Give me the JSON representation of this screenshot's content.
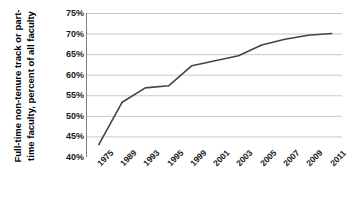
{
  "chart_data": {
    "type": "line",
    "title": "",
    "xlabel": "",
    "ylabel": "Full-time non-tenure track or part-time faculty, percent of all faculty",
    "ylabel_lines": [
      "Full-time  non-tenure  track  or  part-",
      "time faculty, percent of all faculty"
    ],
    "categories": [
      "1975",
      "1989",
      "1993",
      "1995",
      "1999",
      "2001",
      "2003",
      "2005",
      "2007",
      "2009",
      "2011"
    ],
    "x": [
      1975,
      1989,
      1993,
      1995,
      1999,
      2001,
      2003,
      2005,
      2007,
      2009,
      2011
    ],
    "values": [
      43.0,
      53.3,
      56.8,
      57.3,
      62.2,
      63.4,
      64.6,
      67.2,
      68.6,
      69.6,
      70.0
    ],
    "series": [
      {
        "name": "Full-time non-tenure track or part-time faculty",
        "values": [
          43.0,
          53.3,
          56.8,
          57.3,
          62.2,
          63.4,
          64.6,
          67.2,
          68.6,
          69.6,
          70.0
        ]
      }
    ],
    "ylim": [
      40,
      75
    ],
    "ytick_labels": [
      "75%",
      "70%",
      "65%",
      "60%",
      "55%",
      "50%",
      "45%",
      "40%"
    ],
    "ytick_values": [
      75,
      70,
      65,
      60,
      55,
      50,
      45,
      40
    ],
    "grid": true,
    "legend": "none",
    "line_color": "#444444",
    "grid_color": "#c8c8c8",
    "axis_color": "#808080",
    "background_color": "#ffffff"
  }
}
